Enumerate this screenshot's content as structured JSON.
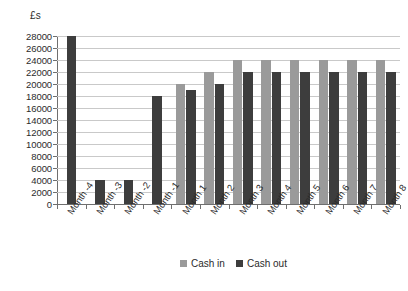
{
  "chart_data": {
    "type": "bar",
    "title": "",
    "ylabel": "£s",
    "xlabel": "",
    "ylim": [
      0,
      28000
    ],
    "ytick_step": 2000,
    "yticks": [
      0,
      2000,
      4000,
      6000,
      8000,
      10000,
      12000,
      14000,
      16000,
      18000,
      20000,
      22000,
      24000,
      26000,
      28000
    ],
    "ytick_labels": [
      "0",
      "2000",
      "4000",
      "6000",
      "8000",
      "10000",
      "12000",
      "14000",
      "16000",
      "18000",
      "20000",
      "22000",
      "24000",
      "26000",
      "28000"
    ],
    "grid": true,
    "legend_position": "bottom",
    "categories": [
      "Month -4",
      "Month -3",
      "Month -2",
      "Month -1",
      "Month 1",
      "Month 2",
      "Month 3",
      "Month 4",
      "Month 5",
      "Month 6",
      "Month 7",
      "Month 8"
    ],
    "series": [
      {
        "name": "Cash in",
        "color": "#9a9a9a",
        "values": [
          null,
          null,
          null,
          null,
          20000,
          22000,
          24000,
          24000,
          24000,
          24000,
          24000,
          24000
        ]
      },
      {
        "name": "Cash out",
        "color": "#3d3d3d",
        "values": [
          28000,
          4000,
          4000,
          18000,
          19000,
          20000,
          22000,
          22000,
          22000,
          22000,
          22000,
          22000
        ]
      }
    ]
  },
  "legend": {
    "items": [
      {
        "label": "Cash in",
        "swatch": "cash-in"
      },
      {
        "label": "Cash out",
        "swatch": "cash-out"
      }
    ]
  }
}
